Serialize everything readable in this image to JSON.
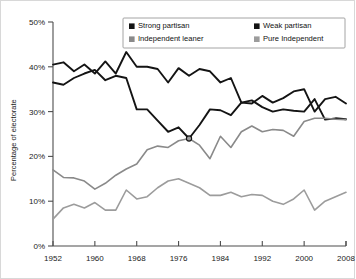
{
  "chart_data": {
    "type": "line",
    "title": "",
    "xlabel": "",
    "ylabel": "Percentage of electorate",
    "xlim": [
      1952,
      2008
    ],
    "ylim": [
      0,
      50
    ],
    "grid": false,
    "legend_position": "top-center",
    "y_ticks": [
      "0%",
      "10%",
      "20%",
      "30%",
      "40%",
      "50%"
    ],
    "y_tick_values": [
      0,
      10,
      20,
      30,
      40,
      50
    ],
    "x_ticks": [
      "1952",
      "1960",
      "1968",
      "1976",
      "1984",
      "1992",
      "2000",
      "2008"
    ],
    "x_tick_values": [
      1952,
      1960,
      1968,
      1976,
      1984,
      1992,
      2000,
      2008
    ],
    "x": [
      1952,
      1954,
      1956,
      1958,
      1960,
      1962,
      1964,
      1966,
      1968,
      1970,
      1972,
      1974,
      1976,
      1978,
      1980,
      1982,
      1984,
      1986,
      1988,
      1990,
      1992,
      1994,
      1996,
      1998,
      2000,
      2002,
      2004,
      2006,
      2008
    ],
    "annotations": [
      {
        "label": "crossing-marker",
        "x": 1978,
        "y": 24
      }
    ],
    "series": [
      {
        "name": "Strong partisan",
        "color": "#141414",
        "width": 1.9,
        "values": [
          36.5,
          36.0,
          37.5,
          38.5,
          39.3,
          37.0,
          38.0,
          37.5,
          30.5,
          30.5,
          28.0,
          25.5,
          26.5,
          24.0,
          27.0,
          30.5,
          30.3,
          29.2,
          32.0,
          31.8,
          33.5,
          32.0,
          33.0,
          34.5,
          35.0,
          30.0,
          32.8,
          33.3,
          31.8
        ]
      },
      {
        "name": "Weak partisan",
        "color": "#141414",
        "width": 1.9,
        "values": [
          40.5,
          41.0,
          39.0,
          40.5,
          38.5,
          41.2,
          38.5,
          43.3,
          40.0,
          40.0,
          39.5,
          36.5,
          39.7,
          38.0,
          39.5,
          39.0,
          36.5,
          37.5,
          32.0,
          32.5,
          31.0,
          30.0,
          30.5,
          30.2,
          30.0,
          32.8,
          28.2,
          28.5,
          28.3
        ]
      },
      {
        "name": "Independent leaner",
        "color": "#8a8a8a",
        "width": 1.6,
        "values": [
          17.0,
          15.3,
          15.2,
          14.5,
          12.7,
          14.0,
          15.8,
          17.2,
          18.3,
          21.5,
          22.3,
          22.0,
          23.5,
          24.0,
          22.5,
          19.5,
          24.5,
          22.0,
          25.5,
          26.8,
          25.5,
          26.0,
          25.8,
          24.5,
          27.8,
          28.5,
          28.5,
          28.3,
          28.2
        ]
      },
      {
        "name": "Pure Independent",
        "color": "#9c9c9c",
        "width": 1.6,
        "values": [
          6.0,
          8.5,
          9.3,
          8.5,
          9.7,
          8.0,
          8.0,
          12.5,
          10.5,
          11.0,
          13.0,
          14.5,
          15.0,
          14.0,
          13.0,
          11.3,
          11.3,
          12.0,
          11.0,
          11.5,
          11.3,
          10.0,
          9.3,
          10.5,
          12.5,
          8.0,
          10.0,
          11.0,
          12.0
        ]
      }
    ]
  },
  "legend": {
    "entries": [
      {
        "label": "Strong partisan",
        "swatch": "#141414"
      },
      {
        "label": "Weak partisan",
        "swatch": "#141414"
      },
      {
        "label": "Independent leaner",
        "swatch": "#8a8a8a"
      },
      {
        "label": "Pure Independent",
        "swatch": "#9c9c9c"
      }
    ]
  }
}
